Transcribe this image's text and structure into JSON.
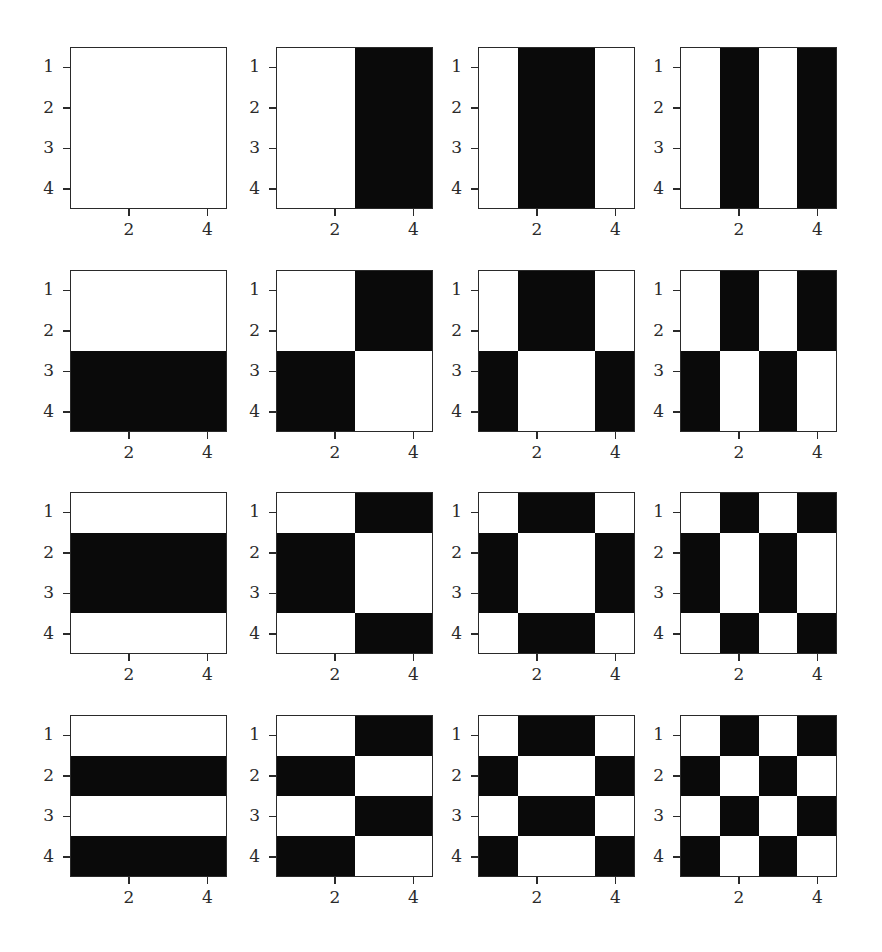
{
  "chart_data": {
    "type": "heatmap",
    "title": "",
    "layout": {
      "rows": 4,
      "cols": 4
    },
    "colors": {
      "on": "#0a0a0a",
      "off": "#ffffff",
      "axis": "#2a2a2a"
    },
    "xticks": [
      2,
      4
    ],
    "yticks": [
      1,
      2,
      3,
      4
    ],
    "xlim": [
      0.5,
      4.5
    ],
    "ylim": [
      4.5,
      0.5
    ],
    "panels": [
      {
        "row": 0,
        "col": 0,
        "matrix": [
          [
            0,
            0,
            0,
            0
          ],
          [
            0,
            0,
            0,
            0
          ],
          [
            0,
            0,
            0,
            0
          ],
          [
            0,
            0,
            0,
            0
          ]
        ]
      },
      {
        "row": 0,
        "col": 1,
        "matrix": [
          [
            0,
            0,
            1,
            1
          ],
          [
            0,
            0,
            1,
            1
          ],
          [
            0,
            0,
            1,
            1
          ],
          [
            0,
            0,
            1,
            1
          ]
        ]
      },
      {
        "row": 0,
        "col": 2,
        "matrix": [
          [
            0,
            1,
            1,
            0
          ],
          [
            0,
            1,
            1,
            0
          ],
          [
            0,
            1,
            1,
            0
          ],
          [
            0,
            1,
            1,
            0
          ]
        ]
      },
      {
        "row": 0,
        "col": 3,
        "matrix": [
          [
            0,
            1,
            0,
            1
          ],
          [
            0,
            1,
            0,
            1
          ],
          [
            0,
            1,
            0,
            1
          ],
          [
            0,
            1,
            0,
            1
          ]
        ]
      },
      {
        "row": 1,
        "col": 0,
        "matrix": [
          [
            0,
            0,
            0,
            0
          ],
          [
            0,
            0,
            0,
            0
          ],
          [
            1,
            1,
            1,
            1
          ],
          [
            1,
            1,
            1,
            1
          ]
        ]
      },
      {
        "row": 1,
        "col": 1,
        "matrix": [
          [
            0,
            0,
            1,
            1
          ],
          [
            0,
            0,
            1,
            1
          ],
          [
            1,
            1,
            0,
            0
          ],
          [
            1,
            1,
            0,
            0
          ]
        ]
      },
      {
        "row": 1,
        "col": 2,
        "matrix": [
          [
            0,
            1,
            1,
            0
          ],
          [
            0,
            1,
            1,
            0
          ],
          [
            1,
            0,
            0,
            1
          ],
          [
            1,
            0,
            0,
            1
          ]
        ]
      },
      {
        "row": 1,
        "col": 3,
        "matrix": [
          [
            0,
            1,
            0,
            1
          ],
          [
            0,
            1,
            0,
            1
          ],
          [
            1,
            0,
            1,
            0
          ],
          [
            1,
            0,
            1,
            0
          ]
        ]
      },
      {
        "row": 2,
        "col": 0,
        "matrix": [
          [
            0,
            0,
            0,
            0
          ],
          [
            1,
            1,
            1,
            1
          ],
          [
            1,
            1,
            1,
            1
          ],
          [
            0,
            0,
            0,
            0
          ]
        ]
      },
      {
        "row": 2,
        "col": 1,
        "matrix": [
          [
            0,
            0,
            1,
            1
          ],
          [
            1,
            1,
            0,
            0
          ],
          [
            1,
            1,
            0,
            0
          ],
          [
            0,
            0,
            1,
            1
          ]
        ]
      },
      {
        "row": 2,
        "col": 2,
        "matrix": [
          [
            0,
            1,
            1,
            0
          ],
          [
            1,
            0,
            0,
            1
          ],
          [
            1,
            0,
            0,
            1
          ],
          [
            0,
            1,
            1,
            0
          ]
        ]
      },
      {
        "row": 2,
        "col": 3,
        "matrix": [
          [
            0,
            1,
            0,
            1
          ],
          [
            1,
            0,
            1,
            0
          ],
          [
            1,
            0,
            1,
            0
          ],
          [
            0,
            1,
            0,
            1
          ]
        ]
      },
      {
        "row": 3,
        "col": 0,
        "matrix": [
          [
            0,
            0,
            0,
            0
          ],
          [
            1,
            1,
            1,
            1
          ],
          [
            0,
            0,
            0,
            0
          ],
          [
            1,
            1,
            1,
            1
          ]
        ]
      },
      {
        "row": 3,
        "col": 1,
        "matrix": [
          [
            0,
            0,
            1,
            1
          ],
          [
            1,
            1,
            0,
            0
          ],
          [
            0,
            0,
            1,
            1
          ],
          [
            1,
            1,
            0,
            0
          ]
        ]
      },
      {
        "row": 3,
        "col": 2,
        "matrix": [
          [
            0,
            1,
            1,
            0
          ],
          [
            1,
            0,
            0,
            1
          ],
          [
            0,
            1,
            1,
            0
          ],
          [
            1,
            0,
            0,
            1
          ]
        ]
      },
      {
        "row": 3,
        "col": 3,
        "matrix": [
          [
            0,
            1,
            0,
            1
          ],
          [
            1,
            0,
            1,
            0
          ],
          [
            0,
            1,
            0,
            1
          ],
          [
            1,
            0,
            1,
            0
          ]
        ]
      }
    ]
  },
  "geometry": {
    "col_left": [
      70,
      276,
      478,
      680
    ],
    "row_top": [
      47,
      270,
      492,
      715
    ],
    "frame_w": 157,
    "frame_h": 162
  }
}
